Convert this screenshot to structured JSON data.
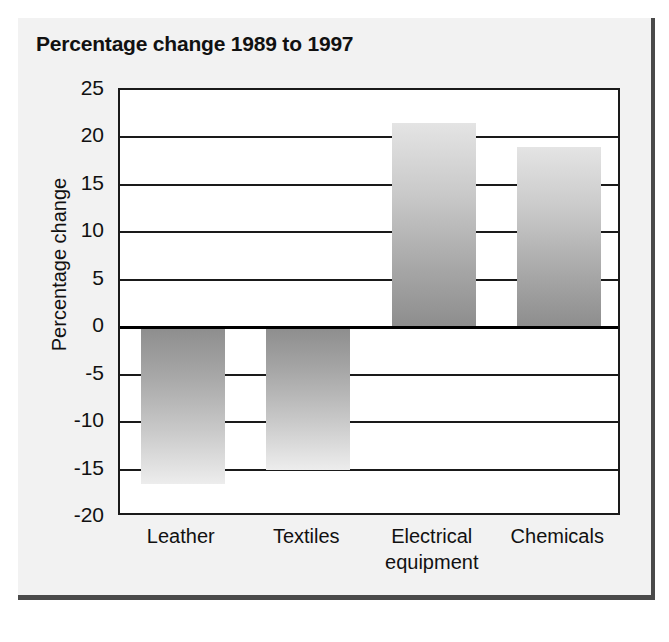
{
  "chart_data": {
    "type": "bar",
    "title": "Percentage change 1989 to 1997",
    "xlabel": "",
    "ylabel": "Percentage change",
    "categories": [
      "Leather",
      "Textiles",
      "Electrical equipment",
      "Chemicals"
    ],
    "values": [
      -16.5,
      -15,
      21.5,
      19
    ],
    "ylim": [
      -20,
      25
    ],
    "ytick_labels": [
      "25",
      "20",
      "15",
      "10",
      "5",
      "0",
      "-5",
      "-10",
      "-15",
      "-20"
    ],
    "ytick_values": [
      25,
      20,
      15,
      10,
      5,
      0,
      -5,
      -10,
      -15,
      -20
    ],
    "grid": true,
    "legend": "none",
    "bar_fill": "grey-gradient",
    "colors": {
      "bar_light": "#e4e4e4",
      "bar_dark": "#8d8d8d",
      "axis": "#1a1a1a",
      "text": "#111111",
      "figure_background": "#f2f2f2",
      "plot_background": "#ffffff",
      "frame_shadow": "#4a4a4a"
    }
  },
  "figure": {
    "title": "Percentage change 1989 to 1997",
    "y_axis_title": "Percentage change",
    "y_ticks": [
      {
        "label": "25",
        "value": 25
      },
      {
        "label": "20",
        "value": 20
      },
      {
        "label": "15",
        "value": 15
      },
      {
        "label": "10",
        "value": 10
      },
      {
        "label": "5",
        "value": 5
      },
      {
        "label": "0",
        "value": 0
      },
      {
        "label": "-5",
        "value": -5
      },
      {
        "label": "-10",
        "value": -10
      },
      {
        "label": "-15",
        "value": -15
      },
      {
        "label": "-20",
        "value": -20
      }
    ],
    "bars": [
      {
        "label_line1": "Leather",
        "label_line2": "",
        "value": -16.5
      },
      {
        "label_line1": "Textiles",
        "label_line2": "",
        "value": -15
      },
      {
        "label_line1": "Electrical",
        "label_line2": "equipment",
        "value": 21.5
      },
      {
        "label_line1": "Chemicals",
        "label_line2": "",
        "value": 19
      }
    ]
  }
}
